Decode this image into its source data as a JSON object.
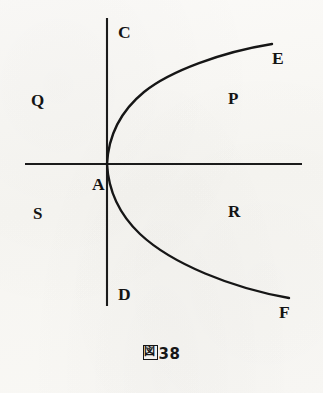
{
  "figure": {
    "caption": "図38",
    "caption_glyph": "図",
    "caption_number": "38",
    "background_color": "#f8f7f4",
    "ink_color": "#161616"
  },
  "axes": {
    "vertical": {
      "top_label": "C",
      "bottom_label": "D",
      "x": 107,
      "y_top": 18,
      "y_bottom": 306
    },
    "horizontal": {
      "y": 164,
      "x_left": 25,
      "x_right": 302
    }
  },
  "points": [
    {
      "label": "A",
      "role": "vertex-origin",
      "x": 92,
      "y": 183
    },
    {
      "label": "C",
      "role": "vertical-axis-top",
      "x": 118,
      "y": 24
    },
    {
      "label": "D",
      "role": "vertical-axis-bottom",
      "x": 118,
      "y": 286
    },
    {
      "label": "E",
      "role": "upper-branch-end",
      "x": 272,
      "y": 50
    },
    {
      "label": "F",
      "role": "lower-branch-end",
      "x": 279,
      "y": 304
    }
  ],
  "regions": [
    {
      "label": "Q",
      "position": "upper-left",
      "x": 31,
      "y": 92
    },
    {
      "label": "P",
      "position": "upper-right",
      "x": 228,
      "y": 90
    },
    {
      "label": "S",
      "position": "lower-left",
      "x": 33,
      "y": 205
    },
    {
      "label": "R",
      "position": "lower-right",
      "x": 228,
      "y": 203
    }
  ],
  "curve": {
    "name": "rightward-opening-parabola",
    "vertex": {
      "x": 107,
      "y": 164
    },
    "upper_branch_path": "M 107 164 C 108.5 135 122 110 144 92 C 170 71 222 52 272 44",
    "lower_branch_path": "M 107 164 C 108.5 192 120 215 140 234 C 172 264 232 288 289 298"
  }
}
